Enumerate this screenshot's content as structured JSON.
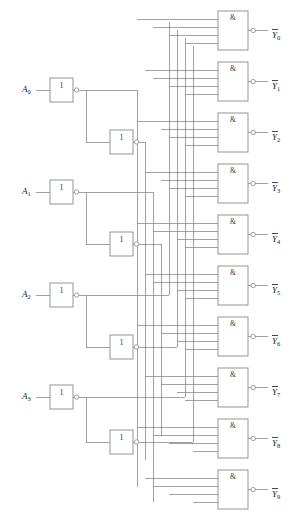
{
  "diagram": {
    "type": "logic-circuit-schematic",
    "wire_color": "#8a8a8a",
    "text_color": "#1a1a1a",
    "background": "#ffffff"
  },
  "inputs": [
    {
      "id": "A0",
      "base": "A",
      "sub": "0",
      "x": 22,
      "y": 90
    },
    {
      "id": "A1",
      "base": "A",
      "sub": "1",
      "x": 22,
      "y": 192
    },
    {
      "id": "A2",
      "base": "A",
      "sub": "2",
      "x": 22,
      "y": 295
    },
    {
      "id": "A3",
      "base": "A",
      "sub": "3",
      "x": 22,
      "y": 397
    }
  ],
  "outputs": [
    {
      "id": "Y0",
      "base": "Y",
      "sub": "0",
      "x": 272,
      "y": 36
    },
    {
      "id": "Y1",
      "base": "Y",
      "sub": "1",
      "x": 272,
      "y": 87
    },
    {
      "id": "Y2",
      "base": "Y",
      "sub": "2",
      "x": 272,
      "y": 138
    },
    {
      "id": "Y3",
      "base": "Y",
      "sub": "3",
      "x": 272,
      "y": 189
    },
    {
      "id": "Y4",
      "base": "Y",
      "sub": "4",
      "x": 272,
      "y": 240
    },
    {
      "id": "Y5",
      "base": "Y",
      "sub": "5",
      "x": 272,
      "y": 291
    },
    {
      "id": "Y6",
      "base": "Y",
      "sub": "6",
      "x": 272,
      "y": 342
    },
    {
      "id": "Y7",
      "base": "Y",
      "sub": "7",
      "x": 272,
      "y": 393
    },
    {
      "id": "Y8",
      "base": "Y",
      "sub": "8",
      "x": 272,
      "y": 444
    },
    {
      "id": "Y9",
      "base": "Y",
      "sub": "9",
      "x": 272,
      "y": 495
    }
  ],
  "inverters": [
    {
      "id": "INV-A0-1",
      "label": "1",
      "x": 50,
      "y": 78,
      "w": 23,
      "h": 24,
      "stage": 1,
      "source": "A0"
    },
    {
      "id": "INV-A0-2",
      "label": "1",
      "x": 110,
      "y": 130,
      "w": 23,
      "h": 24,
      "stage": 2,
      "source": "A0"
    },
    {
      "id": "INV-A1-1",
      "label": "1",
      "x": 50,
      "y": 180,
      "w": 23,
      "h": 24,
      "stage": 1,
      "source": "A1"
    },
    {
      "id": "INV-A1-2",
      "label": "1",
      "x": 110,
      "y": 232,
      "w": 23,
      "h": 24,
      "stage": 2,
      "source": "A1"
    },
    {
      "id": "INV-A2-1",
      "label": "1",
      "x": 50,
      "y": 283,
      "w": 23,
      "h": 24,
      "stage": 1,
      "source": "A2"
    },
    {
      "id": "INV-A2-2",
      "label": "1",
      "x": 110,
      "y": 335,
      "w": 23,
      "h": 24,
      "stage": 2,
      "source": "A2"
    },
    {
      "id": "INV-A3-1",
      "label": "1",
      "x": 50,
      "y": 385,
      "w": 23,
      "h": 24,
      "stage": 1,
      "source": "A3"
    },
    {
      "id": "INV-A3-2",
      "label": "1",
      "x": 110,
      "y": 430,
      "w": 23,
      "h": 24,
      "stage": 2,
      "source": "A3"
    }
  ],
  "and_gates": [
    {
      "id": "AND0",
      "label": "&",
      "x": 218,
      "y": 11,
      "w": 30,
      "h": 39,
      "output": "Y0"
    },
    {
      "id": "AND1",
      "label": "&",
      "x": 218,
      "y": 62,
      "w": 30,
      "h": 39,
      "output": "Y1"
    },
    {
      "id": "AND2",
      "label": "&",
      "x": 218,
      "y": 113,
      "w": 30,
      "h": 39,
      "output": "Y2"
    },
    {
      "id": "AND3",
      "label": "&",
      "x": 218,
      "y": 164,
      "w": 30,
      "h": 39,
      "output": "Y3"
    },
    {
      "id": "AND4",
      "label": "&",
      "x": 218,
      "y": 215,
      "w": 30,
      "h": 39,
      "output": "Y4"
    },
    {
      "id": "AND5",
      "label": "&",
      "x": 218,
      "y": 266,
      "w": 30,
      "h": 39,
      "output": "Y5"
    },
    {
      "id": "AND6",
      "label": "&",
      "x": 218,
      "y": 317,
      "w": 30,
      "h": 39,
      "output": "Y6"
    },
    {
      "id": "AND7",
      "label": "&",
      "x": 218,
      "y": 368,
      "w": 30,
      "h": 39,
      "output": "Y7"
    },
    {
      "id": "AND8",
      "label": "&",
      "x": 218,
      "y": 419,
      "w": 30,
      "h": 39,
      "output": "Y8"
    },
    {
      "id": "AND9",
      "label": "&",
      "x": 218,
      "y": 470,
      "w": 30,
      "h": 39,
      "output": "Y9"
    }
  ],
  "gate_input_count": 4,
  "bus_columns": [
    {
      "id": "bus-1",
      "x": 137
    },
    {
      "id": "bus-2",
      "x": 145
    },
    {
      "id": "bus-3",
      "x": 153
    },
    {
      "id": "bus-4",
      "x": 161
    },
    {
      "id": "bus-5",
      "x": 169
    },
    {
      "id": "bus-6",
      "x": 177
    },
    {
      "id": "bus-7",
      "x": 185
    },
    {
      "id": "bus-8",
      "x": 193
    }
  ]
}
